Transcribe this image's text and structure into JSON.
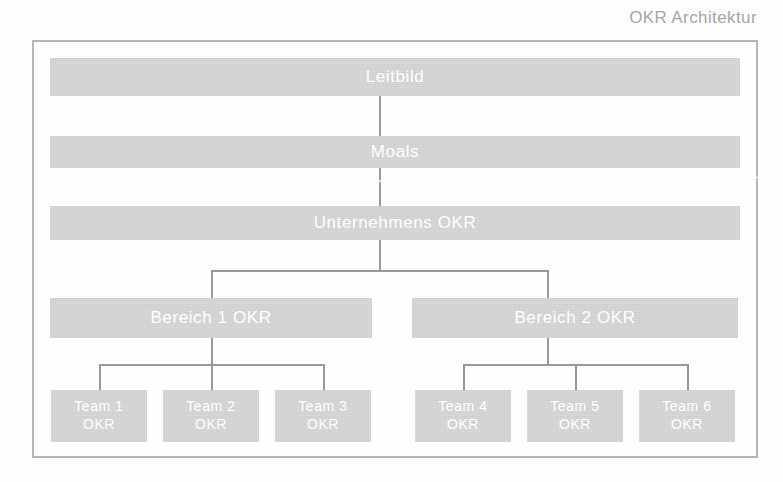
{
  "title": "OKR Architektur",
  "colors": {
    "node_fill": "#d2d2d2",
    "node_text": "#ffffff",
    "frame_border": "#b6b6b6",
    "connector": "#999999",
    "title_text": "#a6a6a6",
    "background": "#ffffff"
  },
  "diagram": {
    "type": "hierarchy",
    "levels": [
      {
        "level": 1,
        "name": "leitbild",
        "nodes": [
          {
            "label": "Leitbild"
          }
        ]
      },
      {
        "level": 2,
        "name": "moals",
        "nodes": [
          {
            "label": "Moals"
          }
        ]
      },
      {
        "level": 3,
        "name": "unternehmens-okr",
        "nodes": [
          {
            "label": "Unternehmens OKR"
          }
        ]
      },
      {
        "level": 4,
        "name": "bereich-okr",
        "nodes": [
          {
            "label": "Bereich 1 OKR"
          },
          {
            "label": "Bereich 2 OKR"
          }
        ]
      },
      {
        "level": 5,
        "name": "team-okr",
        "nodes": [
          {
            "line1": "Team 1",
            "line2": "OKR"
          },
          {
            "line1": "Team 2",
            "line2": "OKR"
          },
          {
            "line1": "Team 3",
            "line2": "OKR"
          },
          {
            "line1": "Team 4",
            "line2": "OKR"
          },
          {
            "line1": "Team 5",
            "line2": "OKR"
          },
          {
            "line1": "Team 6",
            "line2": "OKR"
          }
        ]
      }
    ]
  }
}
